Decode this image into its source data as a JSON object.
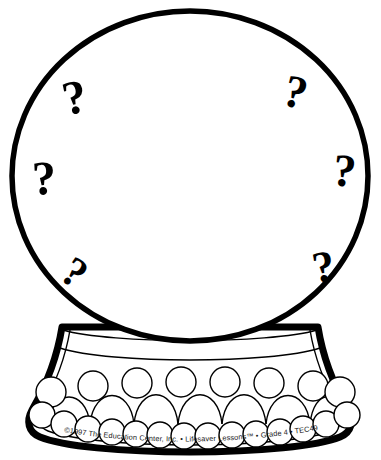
{
  "page": {
    "background_color": "#ffffff",
    "ink_color": "#000000",
    "width": 381,
    "height": 460
  },
  "illustration": {
    "name": "crystal-ball",
    "description": "Line-art crystal ball with question marks on a beaded pedestal base",
    "sphere": {
      "name": "crystal-ball-globe",
      "center_x": 190,
      "center_y": 176,
      "radius_x": 180,
      "radius_y": 166,
      "stroke_width": 5
    },
    "collar": {
      "name": "globe-collar-band",
      "label": ""
    },
    "base": {
      "name": "pedestal-base",
      "upper_bead_count": 8,
      "lower_bead_count": 16
    }
  },
  "question_marks": [
    {
      "id": "qmark-top-left",
      "glyph": "?",
      "x": 78,
      "y": 113,
      "size": 48,
      "rotation": -12
    },
    {
      "id": "qmark-top-right",
      "glyph": "?",
      "x": 292,
      "y": 107,
      "size": 46,
      "rotation": 14
    },
    {
      "id": "qmark-mid-left",
      "glyph": "?",
      "x": 45,
      "y": 194,
      "size": 48,
      "rotation": -3
    },
    {
      "id": "qmark-mid-right",
      "glyph": "?",
      "x": 343,
      "y": 186,
      "size": 46,
      "rotation": 6
    },
    {
      "id": "qmark-bottom-left",
      "glyph": "?",
      "x": 67,
      "y": 284,
      "size": 42,
      "rotation": 34
    },
    {
      "id": "qmark-bottom-right",
      "glyph": "?",
      "x": 326,
      "y": 281,
      "size": 44,
      "rotation": -10
    }
  ],
  "copyright": {
    "name": "copyright-notice",
    "text": "©1997 The Education Center, Inc. • Lifesaver Lessons™ • Grade 4 • TEC495",
    "year": "1997",
    "publisher": "The Education Center, Inc.",
    "series": "Lifesaver Lessons™",
    "grade": "Grade 4",
    "product_code": "TEC495"
  }
}
